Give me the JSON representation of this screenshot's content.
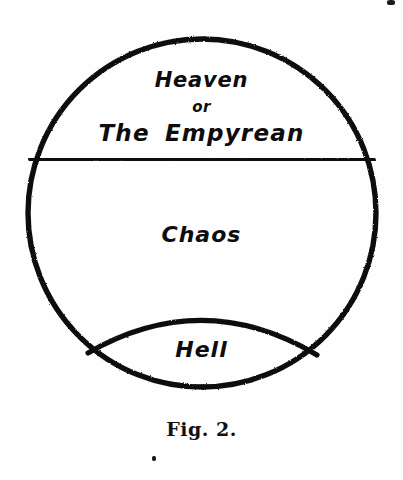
{
  "figure": {
    "caption": "Fig. 2.",
    "ink_color": "#111111",
    "background_color": "#fefefe",
    "regions": [
      {
        "id": "heaven",
        "label_lines": [
          "Heaven",
          "or",
          "The  Empyrean"
        ]
      },
      {
        "id": "chaos",
        "label": "Chaos"
      },
      {
        "id": "hell",
        "label": "Hell"
      }
    ],
    "labels": {
      "heaven": "Heaven",
      "or": "or",
      "empyrean": "The  Empyrean",
      "chaos": "Chaos",
      "hell": "Hell"
    },
    "geometry": {
      "circle": {
        "cx": 202,
        "cy": 213,
        "r": 174
      },
      "chord_y": 159,
      "hell_arc": {
        "x1": 88,
        "y1": 353,
        "x2": 317,
        "y2": 355,
        "apex_y": 305
      }
    }
  }
}
